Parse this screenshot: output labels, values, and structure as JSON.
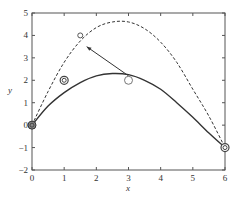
{
  "chart_data": {
    "type": "line",
    "title": "",
    "xlabel": "x",
    "ylabel": "y",
    "xlim": [
      0,
      6
    ],
    "ylim": [
      -2,
      5
    ],
    "xticks": [
      "0",
      "1",
      "2",
      "3",
      "4",
      "5",
      "6"
    ],
    "yticks": [
      "-2",
      "-1",
      "0",
      "1",
      "2",
      "3",
      "4",
      "5"
    ],
    "grid": false,
    "legend": null,
    "series": [
      {
        "name": "solid-curve",
        "style": "solid",
        "x": [
          0,
          0.5,
          1,
          1.5,
          2,
          2.5,
          3,
          3.5,
          4,
          4.5,
          5,
          5.5,
          6
        ],
        "y": [
          0,
          0.85,
          1.45,
          1.9,
          2.2,
          2.3,
          2.25,
          2.0,
          1.6,
          1.0,
          0.35,
          -0.35,
          -1
        ]
      },
      {
        "name": "dashed-curve",
        "style": "dashed",
        "x": [
          0,
          0.5,
          1,
          1.5,
          2,
          2.5,
          3,
          3.5,
          4,
          4.5,
          5,
          5.5,
          6
        ],
        "y": [
          0,
          1.5,
          2.8,
          3.75,
          4.35,
          4.6,
          4.6,
          4.3,
          3.7,
          2.8,
          1.6,
          0.4,
          -1
        ]
      }
    ],
    "markers": [
      {
        "x": 0,
        "y": 0,
        "shape": "circle-filled"
      },
      {
        "x": 1,
        "y": 2,
        "shape": "double-circle"
      },
      {
        "x": 1.5,
        "y": 4,
        "shape": "small-circle"
      },
      {
        "x": 3,
        "y": 2,
        "shape": "open-circle"
      },
      {
        "x": 6,
        "y": -1,
        "shape": "double-circle"
      }
    ],
    "annotations": [
      {
        "type": "arrow",
        "from": [
          3,
          2.2
        ],
        "to": [
          1.7,
          3.5
        ]
      }
    ]
  }
}
